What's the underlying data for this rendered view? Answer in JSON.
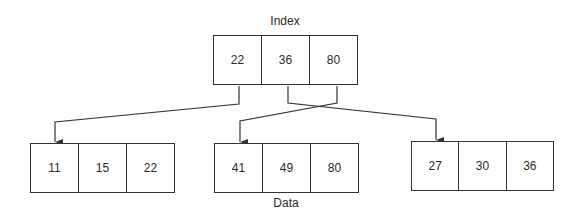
{
  "index": {
    "label": "Index",
    "keys": [
      "22",
      "36",
      "80"
    ]
  },
  "data_label": "Data",
  "data_blocks": [
    {
      "keys": [
        "11",
        "15",
        "22"
      ]
    },
    {
      "keys": [
        "41",
        "49",
        "80"
      ]
    },
    {
      "keys": [
        "27",
        "30",
        "36"
      ]
    }
  ],
  "edges": [
    {
      "from_key": "22",
      "to_block": 0
    },
    {
      "from_key": "36",
      "to_block": 2
    },
    {
      "from_key": "80",
      "to_block": 1
    }
  ]
}
